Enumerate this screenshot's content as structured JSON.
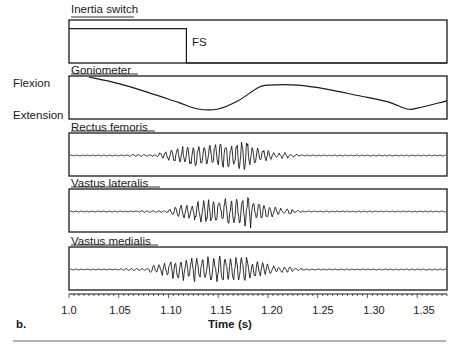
{
  "figure": {
    "panel_letter": "b.",
    "x_axis_label": "Time (s)",
    "side_labels": {
      "flexion": "Flexion",
      "extension": "Extension"
    },
    "fs_marker": "FS"
  },
  "chart_data": {
    "type": "line",
    "title": "",
    "xlabel": "Time (s)",
    "ylabel": "",
    "xlim": [
      1.0,
      1.38
    ],
    "x_ticks": [
      1.0,
      1.05,
      1.1,
      1.15,
      1.2,
      1.25,
      1.3,
      1.35
    ],
    "x_tick_labels": [
      "1.0",
      "1.05",
      "1.10",
      "1.15",
      "1.20",
      "1.25",
      "1.30",
      "1.35"
    ],
    "grid": false,
    "legend": null,
    "annotations": [
      {
        "text": "FS",
        "x": 1.118,
        "panel": "Inertia switch",
        "meaning": "foot strike / switch transition"
      },
      {
        "text": "Flexion",
        "panel": "Goniometer",
        "position": "top-left"
      },
      {
        "text": "Extension",
        "panel": "Goniometer",
        "position": "bottom-left"
      }
    ],
    "series": [
      {
        "name": "Inertia switch",
        "kind": "step",
        "x": [
          1.0,
          1.118,
          1.118,
          1.38
        ],
        "y": [
          1,
          1,
          0,
          0
        ],
        "ylim": [
          0,
          1.25
        ]
      },
      {
        "name": "Goniometer",
        "kind": "smooth",
        "y_meaning": "normalized knee angle, 1 = Flexion, 0 = Extension",
        "x": [
          1.02,
          1.05,
          1.08,
          1.11,
          1.13,
          1.15,
          1.17,
          1.19,
          1.2,
          1.23,
          1.26,
          1.29,
          1.32,
          1.34,
          1.35,
          1.38
        ],
        "y": [
          1.0,
          0.84,
          0.62,
          0.38,
          0.22,
          0.22,
          0.42,
          0.74,
          0.8,
          0.8,
          0.7,
          0.55,
          0.4,
          0.22,
          0.24,
          0.42
        ]
      },
      {
        "name": "Rectus femoris",
        "kind": "emg",
        "burst_start": 1.09,
        "burst_peak": 1.175,
        "burst_end": 1.22,
        "peak_amplitude_rel": 1.0
      },
      {
        "name": "Vastus lateralis",
        "kind": "emg",
        "burst_start": 1.1,
        "burst_peak": 1.178,
        "burst_end": 1.225,
        "peak_amplitude_rel": 1.0
      },
      {
        "name": "Vastus medialis",
        "kind": "emg",
        "burst_start": 1.08,
        "burst_peak": 1.176,
        "burst_end": 1.225,
        "peak_amplitude_rel": 0.85
      }
    ]
  },
  "panels": [
    {
      "id": "inertia",
      "title": "Inertia switch"
    },
    {
      "id": "gonio",
      "title": "Goniometer"
    },
    {
      "id": "rf",
      "title": "Rectus femoris"
    },
    {
      "id": "vl",
      "title": "Vastus lateralis"
    },
    {
      "id": "vm",
      "title": "Vastus medialis"
    }
  ],
  "colors": {
    "ink": "#1a1a1a",
    "rule": "#9a9a9a",
    "background": "#ffffff"
  }
}
